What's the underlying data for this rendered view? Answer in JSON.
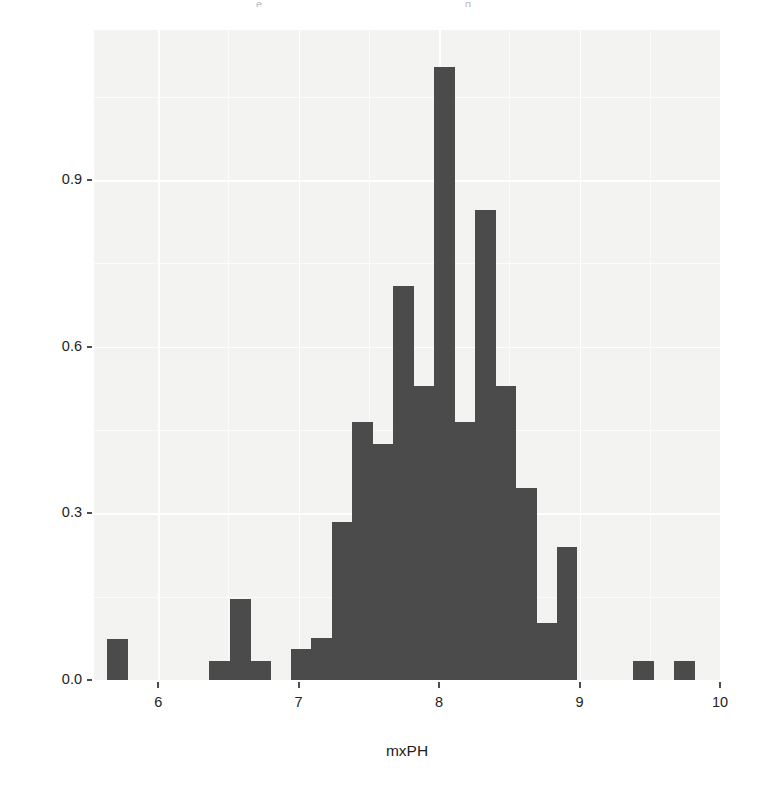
{
  "figure": {
    "ylabel": "density",
    "xlabel": "mxPH",
    "bar_color": "#4b4b4b",
    "panel_color": "#f3f3f1",
    "page_color": "#ffffff"
  },
  "scan_fragments": [
    {
      "text": "e",
      "left": 256,
      "top": 1
    },
    {
      "text": "g",
      "left": 465,
      "top": 1
    }
  ],
  "axes": {
    "y_ticks": [
      "0.0",
      "0.3",
      "0.6",
      "0.9"
    ],
    "y_tick_values": [
      0.0,
      0.3,
      0.6,
      0.9
    ],
    "x_ticks": [
      "6",
      "7",
      "8",
      "9",
      "10"
    ],
    "x_tick_values": [
      6,
      7,
      8,
      9,
      10
    ],
    "y_limits": [
      -0.0345,
      1.1698
    ],
    "x_limits": [
      5.5429,
      10.0
    ],
    "grid": "white lines on light grey panel"
  },
  "chart_data": {
    "type": "bar",
    "subtype": "histogram",
    "title": "",
    "subtitle": "",
    "xlabel": "mxPH",
    "ylabel": "density",
    "xlim": [
      5.5429,
      10.0
    ],
    "ylim": [
      0.0,
      1.1698
    ],
    "grid": true,
    "legend": "none",
    "bin_width": 0.1455,
    "bar_color": "#4b4b4b",
    "note": "Histogram of mxPH plotted on a density scale; bars are contiguous where data are present and absent (zero) elsewhere.",
    "bin_left_edges": [
      5.6364,
      6.3636,
      6.5091,
      6.6545,
      6.9455,
      7.0909,
      7.2364,
      7.3818,
      7.5273,
      7.6727,
      7.8182,
      7.9636,
      8.1091,
      8.2545,
      8.4,
      8.5455,
      8.6909,
      8.8364,
      9.3818,
      9.6727
    ],
    "bin_centers": [
      5.7091,
      6.4364,
      6.5818,
      6.7273,
      7.0182,
      7.1636,
      7.3091,
      7.4545,
      7.6,
      7.7455,
      7.8909,
      8.0364,
      8.1818,
      8.3273,
      8.4727,
      8.6182,
      8.7636,
      8.9091,
      9.4545,
      9.7455
    ],
    "categories": [
      "5.64-5.78",
      "6.36-6.51",
      "6.51-6.65",
      "6.65-6.80",
      "6.95-7.09",
      "7.09-7.24",
      "7.24-7.38",
      "7.38-7.53",
      "7.53-7.67",
      "7.67-7.82",
      "7.82-7.96",
      "7.96-8.11",
      "8.11-8.25",
      "8.25-8.40",
      "8.40-8.55",
      "8.55-8.69",
      "8.69-8.84",
      "8.84-8.98",
      "9.38-9.53",
      "9.67-9.82"
    ],
    "values": [
      0.073,
      0.035,
      0.145,
      0.035,
      0.055,
      0.075,
      0.285,
      0.465,
      0.425,
      0.71,
      0.53,
      1.103,
      0.465,
      0.845,
      0.53,
      0.345,
      0.103,
      0.24,
      0.035,
      0.035
    ],
    "peak": {
      "bin": "7.96-8.11",
      "value": 1.103
    },
    "x": [
      5.7091,
      6.4364,
      6.5818,
      6.7273,
      7.0182,
      7.1636,
      7.3091,
      7.4545,
      7.6,
      7.7455,
      7.8909,
      8.0364,
      8.1818,
      8.3273,
      8.4727,
      8.6182,
      8.7636,
      8.9091,
      9.4545,
      9.7455
    ],
    "y": [
      0.073,
      0.035,
      0.145,
      0.035,
      0.055,
      0.075,
      0.285,
      0.465,
      0.425,
      0.71,
      0.53,
      1.103,
      0.465,
      0.845,
      0.53,
      0.345,
      0.103,
      0.24,
      0.035,
      0.035
    ]
  }
}
